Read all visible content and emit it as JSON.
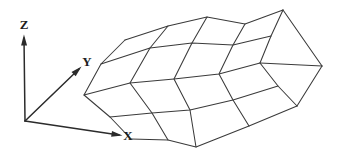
{
  "figure": {
    "background_color": "#ffffff",
    "line_color": "#3a3a3a",
    "axis_color": "#2b2b2b",
    "label_color": "#1d1d1d"
  },
  "axes": {
    "origin": {
      "x": 25,
      "y": 121
    },
    "items": [
      {
        "name": "z-axis",
        "label": "Z",
        "label_pos": {
          "x": 24,
          "y": 26
        },
        "from": {
          "x": 25,
          "y": 121
        },
        "to": {
          "x": 24,
          "y": 38
        }
      },
      {
        "name": "y-axis",
        "label": "Y",
        "label_pos": {
          "x": 87,
          "y": 63
        },
        "from": {
          "x": 25,
          "y": 121
        },
        "to": {
          "x": 79,
          "y": 69
        }
      },
      {
        "name": "x-axis",
        "label": "X",
        "label_pos": {
          "x": 128,
          "y": 137
        },
        "from": {
          "x": 25,
          "y": 121
        },
        "to": {
          "x": 119,
          "y": 135
        }
      }
    ]
  },
  "chart_data": {
    "type": "surface-wireframe",
    "title": "",
    "xlabel": "X",
    "ylabel": "Y",
    "zlabel": "Z",
    "grid": true,
    "legend": null,
    "rows": 4,
    "cols": 5,
    "note": "Quadrilateral mesh patches drawn as a draped/folded sheet rising from lower-left to upper-right",
    "mesh_vertices": [
      [
        {
          "x": 125,
          "y": 40
        },
        {
          "x": 168,
          "y": 26
        },
        {
          "x": 207,
          "y": 17
        },
        {
          "x": 245,
          "y": 24
        },
        {
          "x": 283,
          "y": 10
        }
      ],
      [
        {
          "x": 101,
          "y": 64
        },
        {
          "x": 150,
          "y": 48
        },
        {
          "x": 192,
          "y": 43
        },
        {
          "x": 233,
          "y": 45
        },
        {
          "x": 271,
          "y": 36
        }
      ],
      [
        {
          "x": 84,
          "y": 95
        },
        {
          "x": 130,
          "y": 83
        },
        {
          "x": 174,
          "y": 79
        },
        {
          "x": 219,
          "y": 74
        },
        {
          "x": 260,
          "y": 63
        }
      ],
      [
        {
          "x": 110,
          "y": 117
        },
        {
          "x": 152,
          "y": 113
        },
        {
          "x": 190,
          "y": 110
        },
        {
          "x": 233,
          "y": 100
        },
        {
          "x": 278,
          "y": 86
        }
      ],
      [
        {
          "x": 131,
          "y": 139
        },
        {
          "x": 168,
          "y": 140
        },
        {
          "x": 196,
          "y": 147
        },
        {
          "x": 249,
          "y": 126
        },
        {
          "x": 297,
          "y": 106
        }
      ]
    ],
    "extra_edges": [
      {
        "from": {
          "x": 283,
          "y": 10
        },
        "to": {
          "x": 322,
          "y": 66
        }
      },
      {
        "from": {
          "x": 322,
          "y": 66
        },
        "to": {
          "x": 297,
          "y": 106
        }
      },
      {
        "from": {
          "x": 322,
          "y": 66
        },
        "to": {
          "x": 260,
          "y": 63
        }
      }
    ]
  }
}
